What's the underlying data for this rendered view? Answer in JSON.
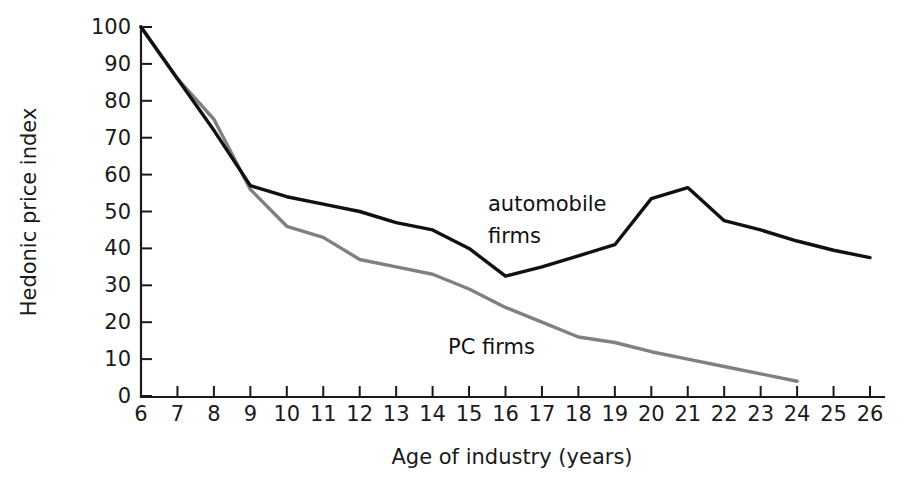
{
  "chart_data": {
    "type": "line",
    "title": "",
    "xlabel": "Age of industry (years)",
    "ylabel": "Hedonic price index",
    "xlim": [
      6,
      26
    ],
    "ylim": [
      0,
      100
    ],
    "grid": false,
    "legend_position": "inline-annotations",
    "xticks": [
      6,
      7,
      8,
      9,
      10,
      11,
      12,
      13,
      14,
      15,
      16,
      17,
      18,
      19,
      20,
      21,
      22,
      23,
      24,
      25,
      26
    ],
    "xtick_labels": [
      "6",
      "7",
      "8",
      "9",
      "10",
      "11",
      "12",
      "13",
      "14",
      "15",
      "16",
      "17",
      "18",
      "19",
      "20",
      "21",
      "22",
      "23",
      "24",
      "25",
      "26"
    ],
    "yticks": [
      0,
      10,
      20,
      30,
      40,
      50,
      60,
      70,
      80,
      90,
      100
    ],
    "ytick_labels": [
      "0",
      "10",
      "20",
      "30",
      "40",
      "50",
      "60",
      "70",
      "80",
      "90",
      "100"
    ],
    "series": [
      {
        "name": "automobile firms",
        "color": "#111111",
        "x": [
          6,
          7,
          8,
          9,
          10,
          11,
          12,
          13,
          14,
          15,
          16,
          17,
          18,
          19,
          20,
          21,
          22,
          23,
          24,
          25,
          26
        ],
        "values": [
          100,
          86,
          72,
          57,
          54,
          52,
          50,
          47,
          45,
          40,
          32.5,
          35,
          38,
          41,
          53.5,
          56.5,
          47.5,
          45,
          42,
          39.5,
          37.5
        ],
        "annotation": "automobile\nfirms"
      },
      {
        "name": "PC firms",
        "color": "#808080",
        "x": [
          6,
          7,
          8,
          9,
          10,
          11,
          12,
          13,
          14,
          15,
          16,
          17,
          18,
          19,
          20,
          21,
          22,
          23,
          24
        ],
        "values": [
          100,
          86,
          75,
          56,
          46,
          43,
          37,
          35,
          33,
          29,
          24,
          20,
          16,
          14.5,
          12,
          10,
          8,
          6,
          4
        ],
        "annotation": "PC firms"
      }
    ],
    "annotations": [
      {
        "text": "automobile",
        "series": "automobile firms",
        "x_px": 488,
        "y_px": 211
      },
      {
        "text": "firms",
        "series": "automobile firms",
        "x_px": 488,
        "y_px": 243
      },
      {
        "text": "PC firms",
        "series": "PC firms",
        "x_px": 448,
        "y_px": 354
      }
    ]
  },
  "axes": {
    "x_title": "Age of industry (years)",
    "y_title": "Hedonic price index"
  }
}
